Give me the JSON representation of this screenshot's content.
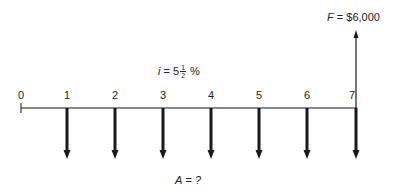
{
  "diagram": {
    "type": "cash-flow-diagram",
    "interest": {
      "symbol": "i",
      "equals": "=",
      "whole": "5",
      "fraction_numerator": "1",
      "fraction_denominator": "2",
      "unit": "%"
    },
    "future_value": {
      "symbol": "F",
      "equals": "=",
      "value": "$6,000",
      "period": 7,
      "direction": "up"
    },
    "annuity": {
      "symbol": "A",
      "equals": "=",
      "value": "?",
      "periods": [
        1,
        2,
        3,
        4,
        5,
        6,
        7
      ],
      "direction": "down"
    },
    "periods": [
      "0",
      "1",
      "2",
      "3",
      "4",
      "5",
      "6",
      "7"
    ],
    "colors": {
      "line": "#1a1a1a",
      "background": "#ffffff"
    }
  }
}
